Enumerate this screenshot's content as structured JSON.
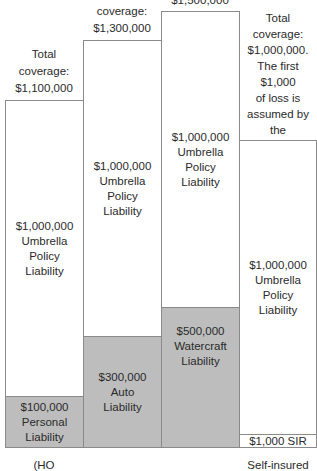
{
  "columns": [
    {
      "total_label": [
        "Total",
        "coverage:",
        "$1,100,000"
      ],
      "umbrella": [
        "$1,000,000",
        "Umbrella",
        "Policy",
        "Liability"
      ],
      "underlying": [
        "$100,000",
        "Personal Liability"
      ],
      "caption": "(HO"
    },
    {
      "total_label": [
        "Total",
        "coverage:",
        "$1,300,000"
      ],
      "umbrella": [
        "$1,000,000",
        "Umbrella",
        "Policy",
        "Liability"
      ],
      "underlying": [
        "$300,000",
        "Auto",
        "Liability"
      ]
    },
    {
      "total_label": [
        "$1,500,000"
      ],
      "umbrella": [
        "$1,000,000",
        "Umbrella",
        "Policy",
        "Liability"
      ],
      "underlying": [
        "$500,000",
        "Watercraft",
        "Liability"
      ]
    },
    {
      "total_label": [
        "Total",
        "coverage:",
        "$1,000,000.",
        "The first",
        "$1,000",
        "of loss is",
        "assumed by the",
        "insured."
      ],
      "umbrella": [
        "$1,000,000",
        "Umbrella",
        "Policy",
        "Liability"
      ],
      "underlying": [
        "$1,000 SIR"
      ],
      "caption": "Self-insured"
    }
  ],
  "colors": {
    "underlying_fill": "#bdbdbd",
    "border": "#8a8a8a"
  }
}
